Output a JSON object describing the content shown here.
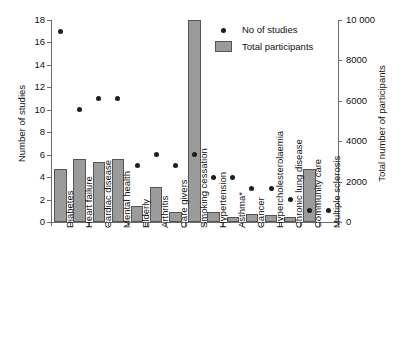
{
  "chart_data": {
    "type": "bar",
    "title": "",
    "xlabel": "",
    "ylabel": "Number of studies",
    "y2label": "Total number of participants",
    "ylim": [
      0,
      18
    ],
    "y2lim": [
      0,
      10000
    ],
    "ytick_labels": [
      "0",
      "2",
      "4",
      "6",
      "8",
      "10",
      "12",
      "14",
      "16",
      "18"
    ],
    "y2tick_labels": [
      "0",
      "2000",
      "4000",
      "6000",
      "8000",
      "10 000"
    ],
    "grid": false,
    "legend_position": "top-right",
    "categories": [
      "Diabetes",
      "Heart failure",
      "Cardiac disease",
      "Mental health",
      "Elderly",
      "Arthritis",
      "Care givers",
      "Smoking cessation",
      "Hypertension",
      "Asthma*",
      "Cancer",
      "Hypercholesterolaemia",
      "Chronic lung disease",
      "Community care",
      "Multiple sclerosis"
    ],
    "series": [
      {
        "name": "No of studies",
        "type": "scatter",
        "axis": "left",
        "marker": "circle",
        "color": "#1d1d1d",
        "values": [
          17,
          10,
          11,
          11,
          5,
          6,
          5,
          6,
          4,
          4,
          3,
          3,
          2,
          1,
          1
        ]
      },
      {
        "name": "Total participants",
        "type": "bar",
        "axis": "right",
        "color": "#9b9b9b",
        "values": [
          2600,
          3100,
          2950,
          3100,
          800,
          1750,
          500,
          10000,
          480,
          250,
          420,
          330,
          230,
          2600,
          0
        ]
      }
    ]
  },
  "legend": {
    "entries": [
      {
        "label": "No of studies",
        "marker": "dot"
      },
      {
        "label": "Total participants",
        "marker": "swatch"
      }
    ]
  }
}
